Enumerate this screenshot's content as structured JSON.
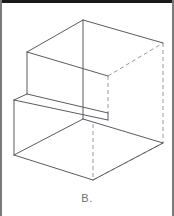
{
  "figure": {
    "caption": "B.",
    "kind": "isometric-line-drawing",
    "colors": {
      "background": "#ffffff",
      "solid_line": "#5a5a62",
      "hidden_line": "#9a9aa2",
      "caption_text": "#6e6e6e",
      "top_rule": "#1a1a1a",
      "side_rule": "#7a7a7a"
    },
    "stroke": {
      "solid_width": 1,
      "hidden_width": 1,
      "hidden_dash": "4 3"
    },
    "vertices": {
      "top_back_apex": [
        83,
        20
      ],
      "top_right": [
        163,
        43
      ],
      "top_left": [
        27,
        52
      ],
      "top_front_inner": [
        108,
        76
      ],
      "mid_center": [
        83,
        118
      ],
      "step_left_upper": [
        27,
        94
      ],
      "step_left_lower": [
        14,
        100
      ],
      "riser_right_upper": [
        108,
        113
      ],
      "riser_right_lower": [
        108,
        120
      ],
      "bottom_left": [
        14,
        155
      ],
      "bottom_front": [
        93,
        180
      ],
      "bottom_right": [
        163,
        143
      ],
      "hidden_back_right": [
        163,
        143
      ]
    },
    "solid_edges": [
      {
        "name": "top-left-ridge",
        "from": [
          83,
          20
        ],
        "to": [
          27,
          52
        ]
      },
      {
        "name": "top-right-ridge",
        "from": [
          83,
          20
        ],
        "to": [
          163,
          43
        ]
      },
      {
        "name": "center-vertical",
        "from": [
          83,
          20
        ],
        "to": [
          83,
          118
        ]
      },
      {
        "name": "upper-left-vertical",
        "from": [
          27,
          52
        ],
        "to": [
          27,
          94
        ]
      },
      {
        "name": "upper-inner-diagonal",
        "from": [
          27,
          52
        ],
        "to": [
          108,
          76
        ]
      },
      {
        "name": "upper-front-vertical",
        "from": [
          108,
          76
        ],
        "to": [
          108,
          113
        ]
      },
      {
        "name": "step-tread-top",
        "from": [
          27,
          94
        ],
        "to": [
          108,
          113
        ]
      },
      {
        "name": "step-tread-front",
        "from": [
          14,
          100
        ],
        "to": [
          108,
          120
        ]
      },
      {
        "name": "step-nose-left",
        "from": [
          27,
          94
        ],
        "to": [
          14,
          100
        ]
      },
      {
        "name": "step-nose-right",
        "from": [
          108,
          113
        ],
        "to": [
          108,
          120
        ]
      },
      {
        "name": "lower-left-vertical",
        "from": [
          14,
          100
        ],
        "to": [
          14,
          155
        ]
      },
      {
        "name": "lower-front-left",
        "from": [
          14,
          155
        ],
        "to": [
          93,
          180
        ]
      },
      {
        "name": "lower-front-right",
        "from": [
          93,
          180
        ],
        "to": [
          163,
          143
        ]
      },
      {
        "name": "lower-inner-diagonal",
        "from": [
          14,
          155
        ],
        "to": [
          83,
          118
        ]
      },
      {
        "name": "lower-right-top",
        "from": [
          83,
          118
        ],
        "to": [
          163,
          143
        ]
      }
    ],
    "hidden_edges": [
      {
        "name": "hidden-upper-right-diagonal",
        "from": [
          108,
          76
        ],
        "to": [
          163,
          43
        ]
      },
      {
        "name": "hidden-upper-front-vertical",
        "from": [
          108,
          76
        ],
        "to": [
          108,
          113
        ]
      },
      {
        "name": "hidden-right-vertical",
        "from": [
          163,
          43
        ],
        "to": [
          163,
          143
        ]
      },
      {
        "name": "hidden-bottom-vertical",
        "from": [
          93,
          125
        ],
        "to": [
          93,
          180
        ]
      },
      {
        "name": "hidden-bottom-right-diagonal",
        "from": [
          93,
          180
        ],
        "to": [
          163,
          143
        ]
      }
    ]
  }
}
